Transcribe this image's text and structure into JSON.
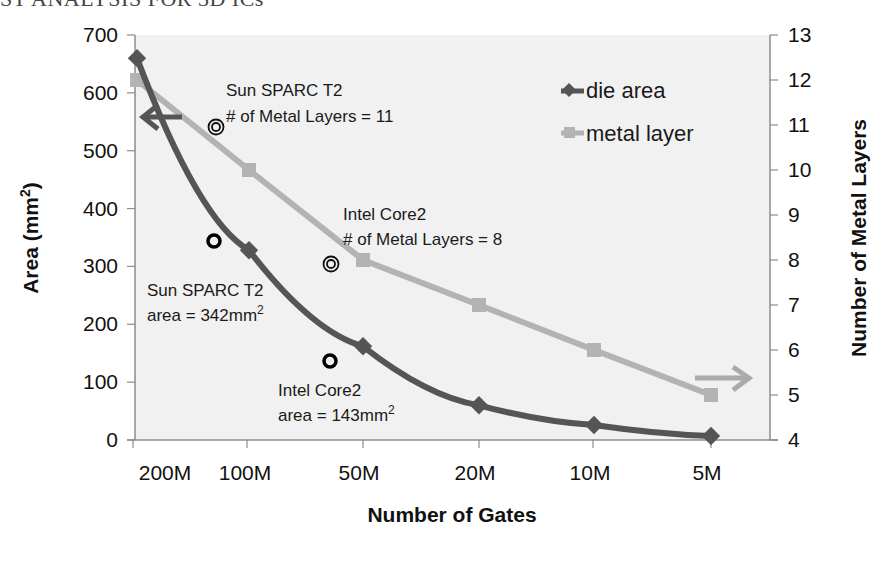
{
  "header_fragment": "ST ANALYSIS FOR 3D ICs",
  "colors": {
    "die_area": "#555555",
    "metal_layer": "#b3b3b3",
    "plot_bg": "#f1f1f1",
    "axis": "#8c8c8c"
  },
  "chart_data": {
    "type": "line",
    "title": "",
    "xlabel": "Number of Gates",
    "ylabel": "Area (mm2)",
    "y2label": "Number of Metal Layers",
    "categories": [
      "200M",
      "100M",
      "50M",
      "20M",
      "10M",
      "5M"
    ],
    "ylim": [
      0,
      700
    ],
    "y2lim": [
      4,
      13
    ],
    "yticks": [
      0,
      100,
      200,
      300,
      400,
      500,
      600,
      700
    ],
    "y2ticks": [
      4,
      5,
      6,
      7,
      8,
      9,
      10,
      11,
      12,
      13
    ],
    "grid": false,
    "legend_position": "upper right",
    "series": [
      {
        "name": "die area",
        "axis": "left",
        "marker": "diamond",
        "values": [
          660,
          328,
          162,
          60,
          26,
          7
        ]
      },
      {
        "name": "metal layer",
        "axis": "right",
        "marker": "square",
        "values": [
          12,
          10,
          8,
          7,
          6,
          5
        ]
      }
    ],
    "annotations": [
      {
        "id": "sparc_layers",
        "lines": [
          "Sun SPARC T2",
          "# of Metal Layers = 11"
        ],
        "marker": "double-circle",
        "x_between": [
          "200M",
          "100M"
        ],
        "y2": 11
      },
      {
        "id": "core2_layers",
        "lines": [
          "Intel Core2",
          "# of Metal Layers = 8"
        ],
        "marker": "double-circle",
        "x_between": [
          "100M",
          "50M"
        ],
        "y2": 8
      },
      {
        "id": "sparc_area",
        "lines": [
          "Sun SPARC T2",
          "area = 342mm",
          "2"
        ],
        "marker": "circle",
        "x_between": [
          "200M",
          "100M"
        ],
        "y": 342
      },
      {
        "id": "core2_area",
        "lines": [
          "Intel Core2",
          "area = 143mm",
          "2"
        ],
        "marker": "circle",
        "x_between": [
          "100M",
          "50M"
        ],
        "y": 143
      }
    ],
    "arrows": [
      {
        "direction": "left",
        "meaning": "die area uses left axis"
      },
      {
        "direction": "right",
        "meaning": "metal layer uses right axis"
      }
    ]
  },
  "labels": {
    "y_title_main": "Area (mm",
    "y_title_sup": "2",
    "y_title_close": ")",
    "y2_title": "Number of Metal Layers",
    "x_title": "Number of Gates",
    "legend_die": "die area",
    "legend_metal": "metal layer",
    "sparc_layers_1": "Sun SPARC T2",
    "sparc_layers_2": "# of Metal Layers = 11",
    "core2_layers_1": "Intel Core2",
    "core2_layers_2": "# of Metal Layers = 8",
    "sparc_area_1": "Sun SPARC T2",
    "sparc_area_2": "area = 342mm",
    "core2_area_1": "Intel Core2",
    "core2_area_2": "area = 143mm",
    "sup2": "2"
  }
}
